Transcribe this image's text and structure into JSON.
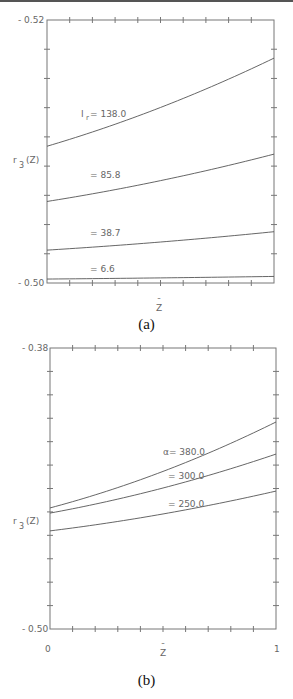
{
  "chart_data": [
    {
      "type": "line",
      "panel": "(a)",
      "title": "",
      "xlabel": "Z̄",
      "ylabel": "r₃(Z)",
      "xlim": [
        0,
        1
      ],
      "ylim": [
        0.5,
        0.52
      ],
      "x_tick_labels": [
        "0",
        "1"
      ],
      "y_tick_labels": [
        "0.52",
        "0.50"
      ],
      "grid": false,
      "legend": "inline labels",
      "x": [
        0,
        1
      ],
      "series": [
        {
          "name": "I_r = 138.0",
          "label": "Iᵣ = 138.0",
          "values": [
            0.5104,
            0.5171
          ]
        },
        {
          "name": "I_r = 85.8",
          "label": "= 85.8",
          "values": [
            0.5062,
            0.5098
          ]
        },
        {
          "name": "I_r = 38.7",
          "label": "= 38.7",
          "values": [
            0.5025,
            0.5039
          ]
        },
        {
          "name": "I_r = 6.6",
          "label": "= 6.6",
          "values": [
            0.5003,
            0.5005
          ]
        }
      ]
    },
    {
      "type": "line",
      "panel": "(b)",
      "title": "",
      "xlabel": "Z̄",
      "ylabel": "r₃(Z)",
      "xlim": [
        0,
        1
      ],
      "ylim": [
        -0.5,
        -0.38
      ],
      "x_tick_labels": [
        "0",
        "1"
      ],
      "y_tick_labels": [
        "-0.38",
        "-0.50"
      ],
      "grid": false,
      "legend": "inline labels",
      "x": [
        0,
        1
      ],
      "series": [
        {
          "name": "α = 380.0",
          "label": "α= 380.0",
          "values": [
            -0.4483,
            -0.4116
          ]
        },
        {
          "name": "α = 300.0",
          "label": "= 300.0",
          "values": [
            -0.4505,
            -0.4253
          ]
        },
        {
          "name": "α = 250.0",
          "label": "= 250.0",
          "values": [
            -0.4581,
            -0.4411
          ]
        }
      ]
    }
  ],
  "panels": {
    "a": {
      "caption": "(a)",
      "y_top": "- 0.52",
      "y_bottom": "- 0.50",
      "x_left": "0",
      "x_right": "1",
      "xlabel": "Z",
      "xlabel_bar": "¯",
      "ylabel_r": "r",
      "ylabel_sub": "3",
      "ylabel_rest": "(Z)",
      "labels": [
        "= 138.0",
        "= 85.8",
        "= 38.7",
        "= 6.6"
      ],
      "label0_prefix": "I",
      "label0_sub": "r"
    },
    "b": {
      "caption": "(b)",
      "y_top": "- 0.38",
      "y_bottom": "- 0.50",
      "x_left": "0",
      "x_right": "1",
      "xlabel": "Z",
      "xlabel_bar": "¯",
      "ylabel_r": "r",
      "ylabel_sub": "3",
      "ylabel_rest": "(Z)",
      "labels": [
        "α= 380.0",
        "= 300.0",
        "= 250.0"
      ]
    }
  }
}
